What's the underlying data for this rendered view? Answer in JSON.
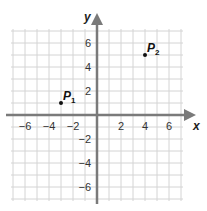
{
  "chart_data": {
    "type": "scatter",
    "title": "",
    "xlabel": "x",
    "ylabel": "y",
    "xlim": [
      -7,
      7
    ],
    "ylim": [
      -7,
      7
    ],
    "grid": true,
    "grid_step": 1,
    "x_ticks": [
      -6,
      -4,
      -2,
      2,
      4,
      6
    ],
    "y_ticks": [
      6,
      4,
      2,
      -2,
      -4,
      -6
    ],
    "x_tick_labels": [
      "−6",
      "−4",
      "−2",
      "2",
      "4",
      "6"
    ],
    "y_tick_labels": [
      "6",
      "4",
      "2",
      "−2",
      "−4",
      "−6"
    ],
    "points": [
      {
        "name": "P1",
        "label": "P",
        "subscript": "1",
        "x": -3,
        "y": 1
      },
      {
        "name": "P2",
        "label": "P",
        "subscript": "2",
        "x": 4,
        "y": 5
      }
    ],
    "legend": null
  },
  "colors": {
    "grid": "#d4d4d4",
    "axis": "#7a7a7a",
    "point": "#111111",
    "text": "#333333"
  },
  "axes": {
    "x_label": "x",
    "y_label": "y"
  }
}
